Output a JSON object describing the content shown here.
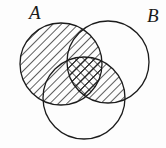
{
  "figure": {
    "type": "venn-diagram",
    "set_count": 3,
    "background_color": "#fdfdfd",
    "stroke_color": "#1b1b1b",
    "hatch_color": "#1b1b1b",
    "canvas": {
      "width": 166,
      "height": 148
    }
  },
  "labels": {
    "a": "A",
    "b": "B",
    "a_position": {
      "x": 29,
      "y": 19
    },
    "b_position": {
      "x": 147,
      "y": 22
    },
    "font_size": 19
  },
  "circles": [
    {
      "id": "A",
      "label": "A",
      "cx": 61,
      "cy": 64,
      "r": 41,
      "fill": "none",
      "shaded": true
    },
    {
      "id": "B",
      "label": "B",
      "cx": 108,
      "cy": 62,
      "r": 41,
      "fill": "none",
      "shaded": false
    },
    {
      "id": "C",
      "label": "",
      "cx": 84,
      "cy": 98,
      "r": 41,
      "fill": "none",
      "shaded": false
    }
  ],
  "regions": [
    {
      "id": "A-only",
      "sets": [
        "A"
      ],
      "shading": "diagonal-hatch",
      "direction": "nw-se"
    },
    {
      "id": "A-and-B",
      "sets": [
        "A",
        "B"
      ],
      "shading": "diagonal-hatch",
      "direction": "nw-se"
    },
    {
      "id": "A-and-C",
      "sets": [
        "A",
        "C"
      ],
      "shading": "diagonal-hatch",
      "direction": "nw-se"
    },
    {
      "id": "A-and-B-and-C",
      "sets": [
        "A",
        "B",
        "C"
      ],
      "shading": "cross-hatch",
      "direction": "both"
    },
    {
      "id": "B-and-C",
      "sets": [
        "B",
        "C"
      ],
      "shading": "diagonal-hatch",
      "direction": "nw-se"
    },
    {
      "id": "B-only",
      "sets": [
        "B"
      ],
      "shading": "none",
      "direction": ""
    },
    {
      "id": "C-only",
      "sets": [
        "C"
      ],
      "shading": "none",
      "direction": ""
    }
  ],
  "shading": {
    "hatch_spacing": 6,
    "hatch_stroke_width": 1.4,
    "circle_stroke_width": 1.3
  }
}
